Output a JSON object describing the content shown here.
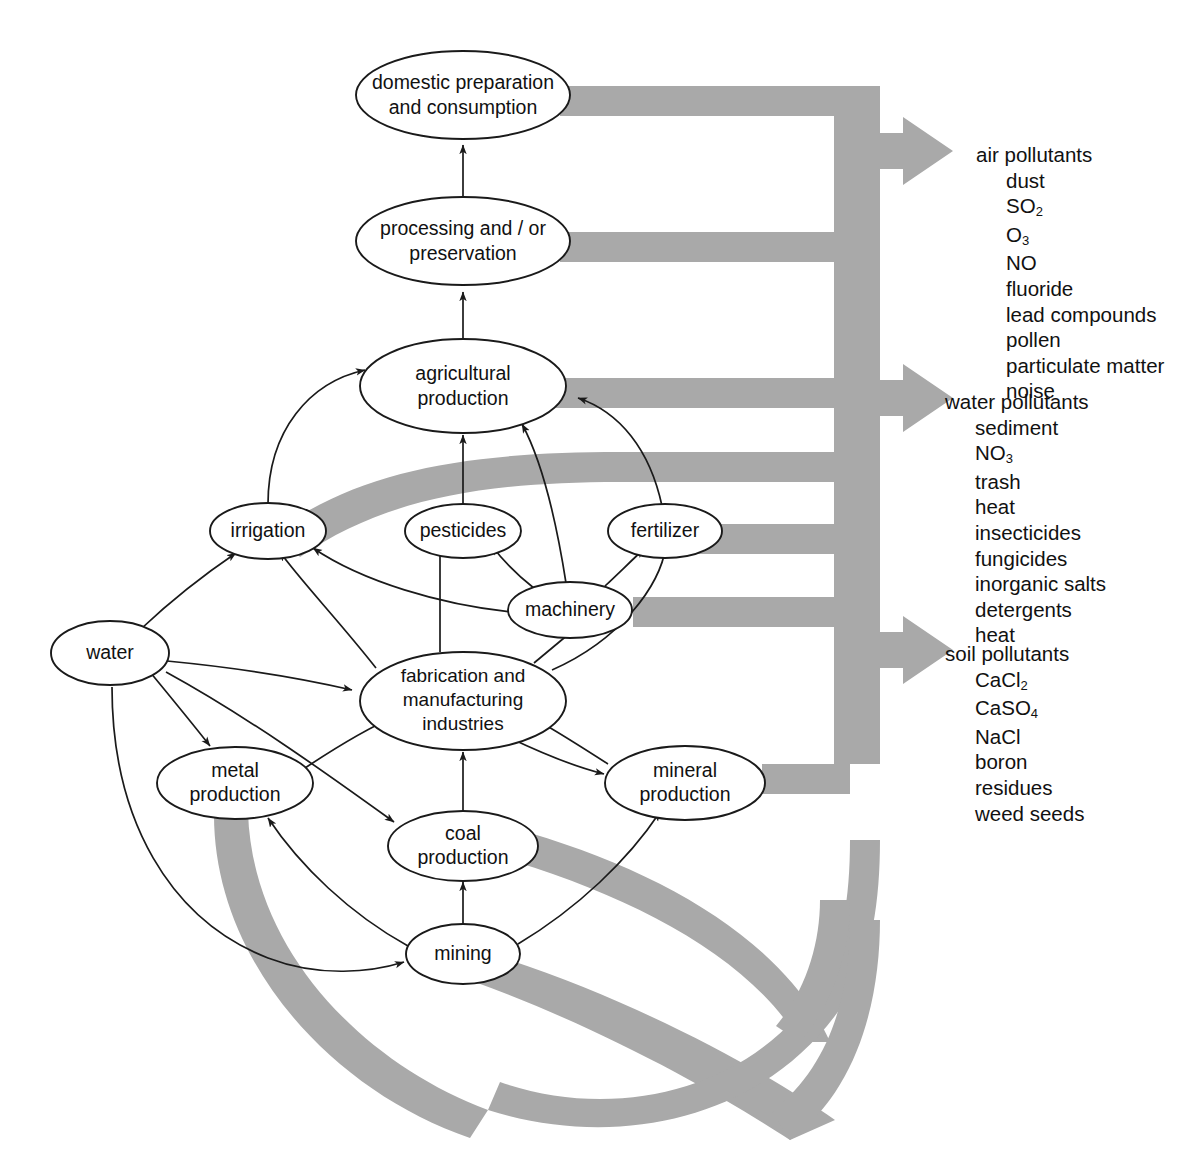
{
  "diagram": {
    "nodes": [
      {
        "id": "domestic",
        "label_lines": [
          "domestic preparation",
          "and consumption"
        ]
      },
      {
        "id": "processing",
        "label_lines": [
          "processing and / or",
          "preservation"
        ]
      },
      {
        "id": "agriculture",
        "label_lines": [
          "agricultural",
          "production"
        ]
      },
      {
        "id": "irrigation",
        "label_lines": [
          "irrigation"
        ]
      },
      {
        "id": "pesticides",
        "label_lines": [
          "pesticides"
        ]
      },
      {
        "id": "fertilizer",
        "label_lines": [
          "fertilizer"
        ]
      },
      {
        "id": "machinery",
        "label_lines": [
          "machinery"
        ]
      },
      {
        "id": "water",
        "label_lines": [
          "water"
        ]
      },
      {
        "id": "fabrication",
        "label_lines": [
          "fabrication and",
          "manufacturing",
          "industries"
        ]
      },
      {
        "id": "metal",
        "label_lines": [
          "metal",
          "production"
        ]
      },
      {
        "id": "mineral",
        "label_lines": [
          "mineral",
          "production"
        ]
      },
      {
        "id": "coal",
        "label_lines": [
          "coal",
          "production"
        ]
      },
      {
        "id": "mining",
        "label_lines": [
          "mining"
        ]
      }
    ],
    "edges": [
      {
        "from": "processing",
        "to": "domestic"
      },
      {
        "from": "agriculture",
        "to": "processing"
      },
      {
        "from": "irrigation",
        "to": "agriculture"
      },
      {
        "from": "pesticides",
        "to": "agriculture"
      },
      {
        "from": "fertilizer",
        "to": "agriculture"
      },
      {
        "from": "machinery",
        "to": "agriculture"
      },
      {
        "from": "machinery",
        "to": "irrigation"
      },
      {
        "from": "machinery",
        "to": "pesticides"
      },
      {
        "from": "machinery",
        "to": "fertilizer"
      },
      {
        "from": "water",
        "to": "irrigation"
      },
      {
        "from": "water",
        "to": "metal production"
      },
      {
        "from": "water",
        "to": "fabrication"
      },
      {
        "from": "water",
        "to": "coal production"
      },
      {
        "from": "water",
        "to": "mining"
      },
      {
        "from": "fabrication",
        "to": "irrigation"
      },
      {
        "from": "fabrication",
        "to": "pesticides"
      },
      {
        "from": "fabrication",
        "to": "fertilizer"
      },
      {
        "from": "fabrication",
        "to": "machinery"
      },
      {
        "from": "metal",
        "to": "fabrication"
      },
      {
        "from": "mineral",
        "to": "fabrication"
      },
      {
        "from": "coal",
        "to": "fabrication"
      },
      {
        "from": "mining",
        "to": "coal production"
      },
      {
        "from": "mining",
        "to": "metal production"
      },
      {
        "from": "mining",
        "to": "mineral production"
      }
    ],
    "pollutant_groups": [
      {
        "id": "air",
        "heading": "air pollutants",
        "items": [
          "dust",
          "SO2",
          "O3",
          "NO",
          "fluoride",
          "lead compounds",
          "pollen",
          "particulate matter",
          "noise"
        ]
      },
      {
        "id": "water",
        "heading": "water pollutants",
        "items": [
          "sediment",
          "NO3",
          "trash",
          "heat",
          "insecticides",
          "fungicides",
          "inorganic salts",
          "detergents",
          "heat"
        ]
      },
      {
        "id": "soil",
        "heading": "soil pollutants",
        "items": [
          "CaCl2",
          "CaSO4",
          "NaCl",
          "boron",
          "residues",
          "weed seeds"
        ]
      }
    ],
    "colors": {
      "pipe_gray": "#a9a9a9",
      "stroke": "#1a1a1a",
      "background": "#ffffff"
    }
  }
}
